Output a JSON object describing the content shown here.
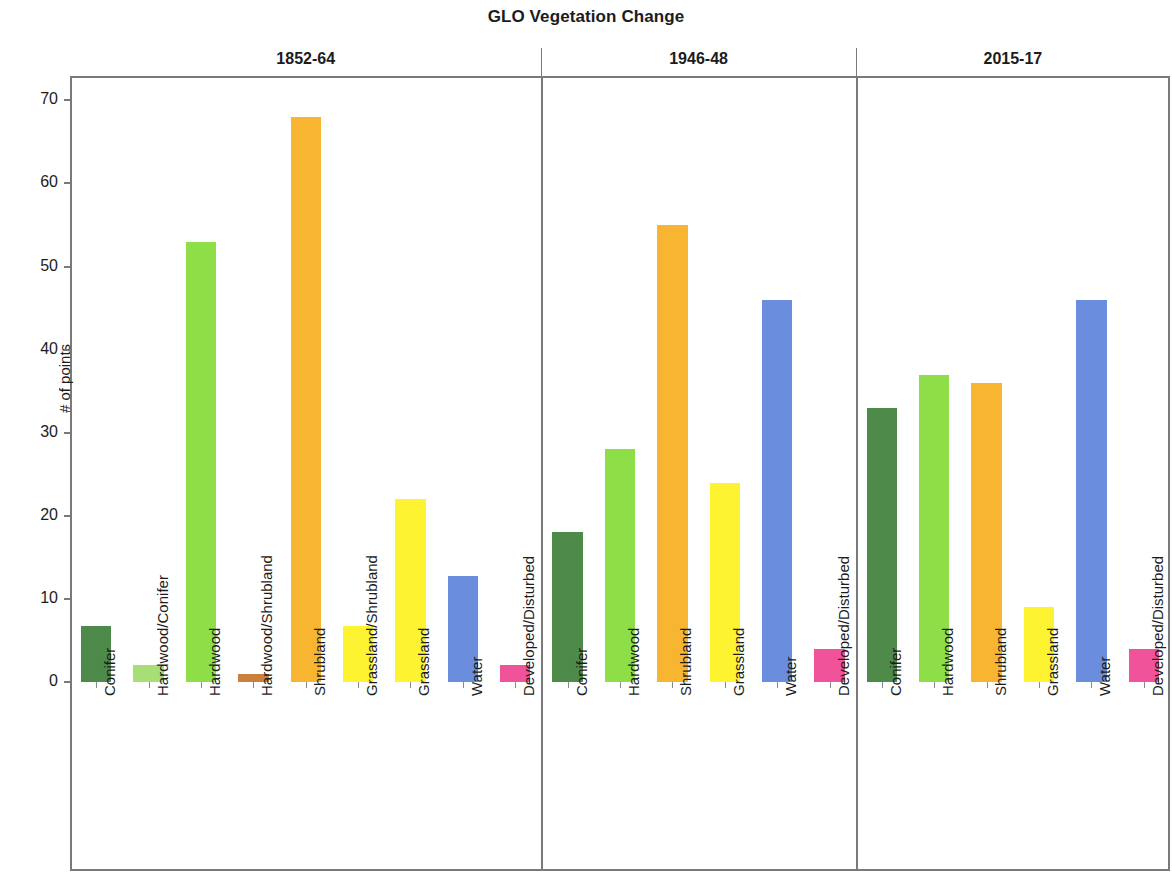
{
  "chart_data": {
    "type": "bar",
    "title": "GLO Vegetation Change",
    "xlabel": "",
    "ylabel": "# of points",
    "ylim": [
      0,
      72
    ],
    "y_ticks": [
      0,
      10,
      20,
      30,
      40,
      50,
      60,
      70
    ],
    "grid": false,
    "legend": "none",
    "panel_layout": "three side-by-side panels sharing one y-axis",
    "panels": [
      {
        "name": "1852-64",
        "categories": [
          "Conifer",
          "Hardwood/Conifer",
          "Hardwood",
          "Hardwood/Shrubland",
          "Shrubland",
          "Grassland/Shrubland",
          "Grassland",
          "Water",
          "Developed/Disturbed"
        ],
        "values": [
          6.7,
          2,
          53,
          1,
          68,
          6.7,
          22,
          12.8,
          2
        ],
        "colors": [
          "#4e8a4a",
          "#a8de76",
          "#8ede47",
          "#c8803c",
          "#f8b531",
          "#fdf330",
          "#fdf330",
          "#6a8ddd",
          "#f0539a"
        ]
      },
      {
        "name": "1946-48",
        "categories": [
          "Conifer",
          "Hardwood",
          "Shrubland",
          "Grassland",
          "Water",
          "Developed/Disturbed"
        ],
        "values": [
          18,
          28,
          55,
          24,
          46,
          4
        ],
        "colors": [
          "#4e8a4a",
          "#8ede47",
          "#f8b531",
          "#fdf330",
          "#6a8ddd",
          "#f0539a"
        ]
      },
      {
        "name": "2015-17",
        "categories": [
          "Conifer",
          "Hardwood",
          "Shrubland",
          "Grassland",
          "Water",
          "Developed/Disturbed"
        ],
        "values": [
          33,
          37,
          36,
          9,
          46,
          4
        ],
        "colors": [
          "#4e8a4a",
          "#8ede47",
          "#f8b531",
          "#fdf330",
          "#6a8ddd",
          "#f0539a"
        ]
      }
    ]
  }
}
